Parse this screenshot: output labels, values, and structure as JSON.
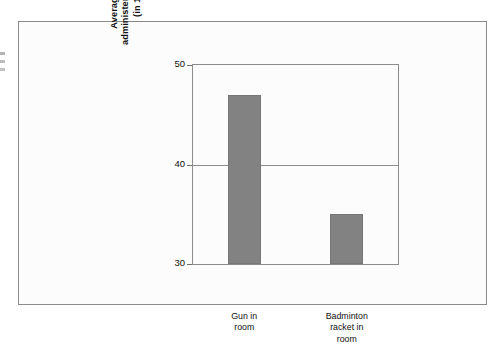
{
  "chart_data": {
    "type": "bar",
    "title": "",
    "subtitle": "",
    "xlabel": "",
    "ylabel": "Average duration of shocks administered by angry participants (in 1000th of a minute)",
    "ylabel_lines": [
      "Average duration of shocks",
      "administered by angry participants",
      "(in 1000th of a minute)"
    ],
    "categories": [
      "Gun in room",
      "Badminton racket in room"
    ],
    "category_lines": [
      [
        "Gun in",
        "room"
      ],
      [
        "Badminton",
        "racket in",
        "room"
      ]
    ],
    "values": [
      47,
      35
    ],
    "ylim": [
      30,
      50
    ],
    "yticks": [
      30,
      40,
      50
    ],
    "ytick_labels": [
      "30",
      "40",
      "50"
    ],
    "grid": true,
    "gridlines_at": [
      40
    ],
    "legend": "none",
    "bar_color": "#828282",
    "axis_color": "#8c8c8c",
    "frame_color": "#8b8b8b",
    "background_color": "#fcfcfc"
  }
}
